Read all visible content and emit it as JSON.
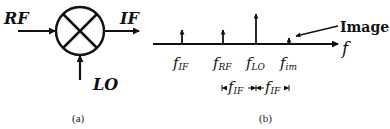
{
  "panel_a": {
    "caption": "(a)",
    "mixer": {
      "symbol": "multiplier-circle"
    },
    "inputs": {
      "rf": "RF",
      "lo": "LO"
    },
    "output": {
      "if": "IF"
    }
  },
  "panel_b": {
    "caption": "(b)",
    "axis_label": "f",
    "image_label": "Image",
    "spectral_lines": [
      {
        "name": "IF",
        "f": "f",
        "sub": "IF",
        "relative_height": "medium"
      },
      {
        "name": "RF",
        "f": "f",
        "sub": "RF",
        "relative_height": "medium"
      },
      {
        "name": "LO",
        "f": "f",
        "sub": "LO",
        "relative_height": "tall"
      },
      {
        "name": "im",
        "f": "f",
        "sub": "im",
        "relative_height": "small"
      }
    ],
    "spacing": [
      {
        "f": "f",
        "sub": "IF"
      },
      {
        "f": "f",
        "sub": "IF"
      }
    ]
  }
}
